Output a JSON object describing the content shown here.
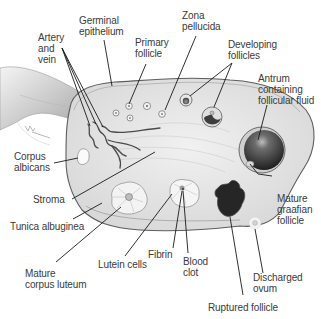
{
  "diagram": {
    "labels": {
      "artery_vein": "Artery\nand\nvein",
      "germinal_epithelium": "Germinal\nepithelium",
      "primary_follicle": "Primary\nfollicle",
      "zona_pellucida": "Zona\npellucida",
      "developing_follicles": "Developing\nfollicles",
      "antrum": "Antrum\ncontaining\nfollicular fluid",
      "corpus_albicans": "Corpus\nalbicans",
      "stroma": "Stroma",
      "tunica_albuginea": "Tunica albuginea",
      "mature_graafian": "Mature\ngraafian\nfollicle",
      "fibrin": "Fibrin",
      "blood_clot": "Blood\nclot",
      "lutein_cells": "Lutein cells",
      "mature_corpus_luteum": "Mature\ncorpus luteum",
      "discharged_ovum": "Discharged\novum",
      "ruptured_follicle": "Ruptured follicle"
    },
    "colors": {
      "ovary_fill": "#e9e9e9",
      "outline": "#6a6a6a",
      "vessel": "#4a4a4a",
      "follicle_dark": "#2e2e2e",
      "leader_line": "#1a1a1a",
      "label_text": "#3a3a3a"
    }
  }
}
